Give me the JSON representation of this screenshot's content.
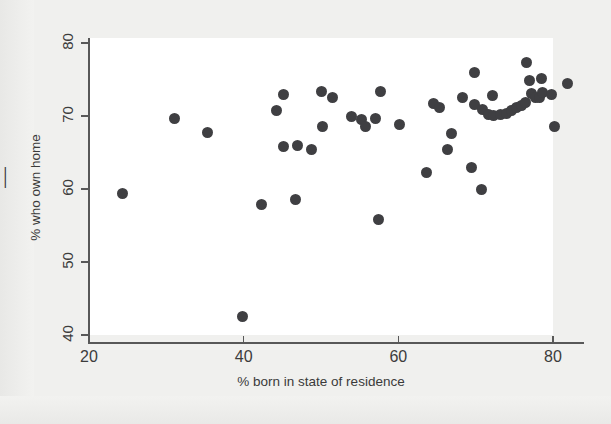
{
  "figure": {
    "background_color": "#f0f0ee",
    "plot_background_color": "#ffffff",
    "axis_color": "#585858",
    "marker_color": "#3f3f42",
    "edge_fragment": "|"
  },
  "chart_data": {
    "type": "scatter",
    "title": "",
    "xlabel": "% born in state of residence",
    "ylabel": "% who own home",
    "xlim": [
      18,
      84
    ],
    "ylim": [
      39,
      80.5
    ],
    "xticks": [
      20,
      40,
      60,
      80
    ],
    "xtick_labels": [
      "20",
      "40",
      "60",
      "80"
    ],
    "yticks": [
      40,
      50,
      60,
      70,
      80
    ],
    "ytick_labels": [
      "40",
      "50",
      "60",
      "70",
      "80"
    ],
    "grid": false,
    "legend": null,
    "marker": "filled-circle",
    "marker_size": 11,
    "n_points": 51,
    "points": [
      {
        "x": 24.3,
        "y": 59.4
      },
      {
        "x": 31.1,
        "y": 69.6
      },
      {
        "x": 35.3,
        "y": 67.7
      },
      {
        "x": 39.9,
        "y": 42.6
      },
      {
        "x": 42.3,
        "y": 57.9
      },
      {
        "x": 44.2,
        "y": 70.8
      },
      {
        "x": 45.2,
        "y": 72.9
      },
      {
        "x": 45.1,
        "y": 65.8
      },
      {
        "x": 46.7,
        "y": 58.6
      },
      {
        "x": 47.0,
        "y": 65.9
      },
      {
        "x": 48.8,
        "y": 65.4
      },
      {
        "x": 50.1,
        "y": 73.4
      },
      {
        "x": 50.2,
        "y": 68.5
      },
      {
        "x": 51.5,
        "y": 72.6
      },
      {
        "x": 53.9,
        "y": 69.9
      },
      {
        "x": 55.3,
        "y": 69.5
      },
      {
        "x": 55.8,
        "y": 68.5
      },
      {
        "x": 57.0,
        "y": 69.6
      },
      {
        "x": 57.4,
        "y": 55.8
      },
      {
        "x": 57.7,
        "y": 73.3
      },
      {
        "x": 60.2,
        "y": 68.8
      },
      {
        "x": 63.7,
        "y": 62.3
      },
      {
        "x": 64.5,
        "y": 71.7
      },
      {
        "x": 65.3,
        "y": 71.2
      },
      {
        "x": 66.3,
        "y": 65.4
      },
      {
        "x": 66.9,
        "y": 67.6
      },
      {
        "x": 68.3,
        "y": 72.5
      },
      {
        "x": 69.5,
        "y": 62.9
      },
      {
        "x": 69.8,
        "y": 75.9
      },
      {
        "x": 69.9,
        "y": 71.6
      },
      {
        "x": 70.7,
        "y": 60.0
      },
      {
        "x": 70.9,
        "y": 70.9
      },
      {
        "x": 71.6,
        "y": 70.2
      },
      {
        "x": 72.2,
        "y": 72.8
      },
      {
        "x": 72.3,
        "y": 70.1
      },
      {
        "x": 73.2,
        "y": 70.2
      },
      {
        "x": 74.0,
        "y": 70.3
      },
      {
        "x": 74.6,
        "y": 70.7
      },
      {
        "x": 75.3,
        "y": 71.2
      },
      {
        "x": 75.9,
        "y": 71.5
      },
      {
        "x": 76.5,
        "y": 71.9
      },
      {
        "x": 76.6,
        "y": 77.3
      },
      {
        "x": 76.9,
        "y": 74.9
      },
      {
        "x": 77.2,
        "y": 73.1
      },
      {
        "x": 77.7,
        "y": 72.5
      },
      {
        "x": 78.3,
        "y": 72.6
      },
      {
        "x": 78.5,
        "y": 75.1
      },
      {
        "x": 78.6,
        "y": 73.2
      },
      {
        "x": 79.8,
        "y": 73.0
      },
      {
        "x": 80.2,
        "y": 68.6
      },
      {
        "x": 81.9,
        "y": 74.5
      }
    ]
  }
}
